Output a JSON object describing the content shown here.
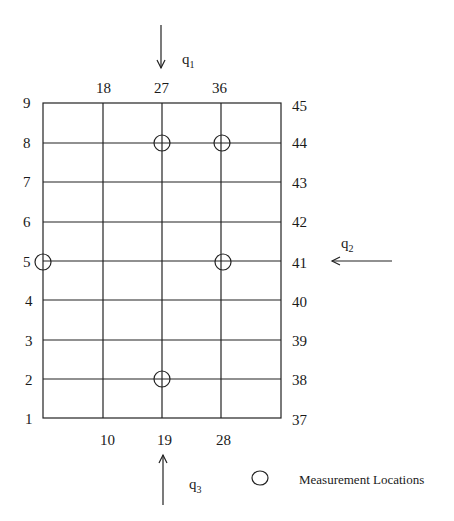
{
  "diagram": {
    "grid": {
      "left_labels": [
        "9",
        "8",
        "7",
        "6",
        "5",
        "4",
        "3",
        "2",
        "1"
      ],
      "right_labels": [
        "45",
        "44",
        "43",
        "42",
        "41",
        "40",
        "39",
        "38",
        "37"
      ],
      "top_labels": [
        "18",
        "27",
        "36"
      ],
      "bottom_labels": [
        "10",
        "19",
        "28"
      ]
    },
    "flows": {
      "q1": {
        "symbol": "q",
        "sub": "1"
      },
      "q2": {
        "symbol": "q",
        "sub": "2"
      },
      "q3": {
        "symbol": "q",
        "sub": "3"
      }
    },
    "measurement_points": [
      {
        "node": "27"
      },
      {
        "node": "36"
      },
      {
        "node": "5"
      },
      {
        "node": "32"
      },
      {
        "node": "19"
      }
    ],
    "legend": {
      "label": "Measurement Locations"
    }
  }
}
